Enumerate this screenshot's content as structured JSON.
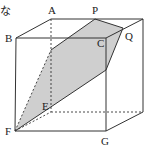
{
  "diagram": {
    "type": "cube-cross-section",
    "partial_text": "な",
    "labels": {
      "A": "A",
      "P": "P",
      "B": "B",
      "C": "C",
      "Q": "Q",
      "E": "E",
      "F": "F",
      "G": "G"
    },
    "colors": {
      "edge": "#333333",
      "section_fill": "#cfcfcf",
      "background": "#ffffff"
    },
    "vertices": {
      "A": [
        51,
        19
      ],
      "P": [
        95,
        19
      ],
      "back_top_right": [
        143,
        19
      ],
      "B": [
        16,
        38
      ],
      "C": [
        106,
        38
      ],
      "Q": [
        123,
        28
      ],
      "F": [
        15,
        131
      ],
      "G": [
        106,
        131
      ],
      "back_bottom_left": [
        51,
        112
      ],
      "back_bottom_right": [
        143,
        112
      ],
      "E": [
        51,
        107
      ]
    },
    "section_polygon": [
      [
        15,
        131
      ],
      [
        51,
        50
      ],
      [
        95,
        19
      ],
      [
        123,
        28
      ],
      [
        106,
        70
      ]
    ]
  }
}
